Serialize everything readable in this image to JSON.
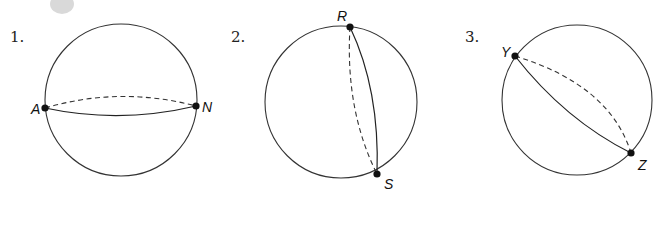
{
  "figures": [
    {
      "number": "1.",
      "number_pos": [
        10,
        42
      ],
      "circle": {
        "cx": 121,
        "cy": 100,
        "r": 76
      },
      "points": [
        {
          "label": "A",
          "x": 45,
          "y": 108,
          "label_x": 31,
          "label_y": 114
        },
        {
          "label": "N",
          "x": 196,
          "y": 106,
          "label_x": 202,
          "label_y": 112
        }
      ],
      "solid_arc": "M45,108 Q120,124 196,106",
      "dashed_arc": "M45,108 Q120,86 196,106"
    },
    {
      "number": "2.",
      "number_pos": [
        231,
        42
      ],
      "circle": {
        "cx": 341,
        "cy": 102,
        "r": 76
      },
      "points": [
        {
          "label": "R",
          "x": 350,
          "y": 27,
          "label_x": 337,
          "label_y": 21
        },
        {
          "label": "S",
          "x": 377,
          "y": 174,
          "label_x": 384,
          "label_y": 189
        }
      ],
      "solid_arc": "M350,27 Q380,90 377,174",
      "dashed_arc": "M350,27 Q345,110 377,174"
    },
    {
      "number": "3.",
      "number_pos": [
        465,
        42
      ],
      "circle": {
        "cx": 577,
        "cy": 100,
        "r": 75
      },
      "points": [
        {
          "label": "Y",
          "x": 515,
          "y": 56,
          "label_x": 501,
          "label_y": 57
        },
        {
          "label": "Z",
          "x": 631,
          "y": 153,
          "label_x": 638,
          "label_y": 170
        }
      ],
      "solid_arc": "M515,56 Q565,120 631,153",
      "dashed_arc": "M515,56 Q610,85 631,153"
    }
  ],
  "colors": {
    "stroke": "#333333",
    "dot": "#111111",
    "background": "#ffffff"
  }
}
